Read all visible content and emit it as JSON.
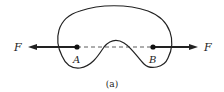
{
  "figure": {
    "caption": "(a)",
    "points": [
      {
        "label": "A"
      },
      {
        "label": "B"
      }
    ],
    "forces": [
      {
        "label": "F",
        "direction": "left",
        "applied_at": "A"
      },
      {
        "label": "F",
        "direction": "right",
        "applied_at": "B"
      }
    ],
    "colors": {
      "stroke": "#222222",
      "background": "#ffffff"
    }
  }
}
